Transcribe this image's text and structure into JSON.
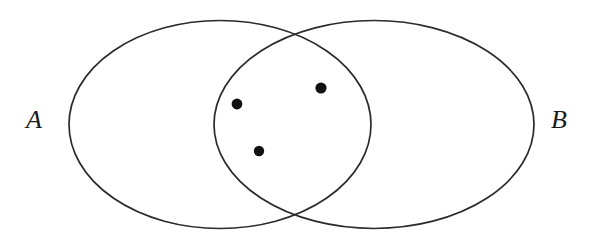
{
  "figure": {
    "type": "venn-diagram",
    "background_color": "#ffffff",
    "stroke_color": "#2b2b2b",
    "stroke_width": 1.7,
    "dot_color": "#111111",
    "width": 605,
    "height": 237
  },
  "sets": [
    {
      "id": "set-a",
      "label": "A",
      "label_x": 26,
      "label_y": 107,
      "shape": "ellipse",
      "cx": 220,
      "cy": 124.5,
      "rx": 151,
      "ry": 104
    },
    {
      "id": "set-b",
      "label": "B",
      "label_x": 551,
      "label_y": 107,
      "shape": "ellipse",
      "cx": 374,
      "cy": 124.5,
      "rx": 160,
      "ry": 104
    }
  ],
  "elements": {
    "region": "intersection",
    "count": 3,
    "points": [
      {
        "id": "element-1",
        "cx": 237,
        "cy": 104,
        "r": 5.4
      },
      {
        "id": "element-2",
        "cx": 321,
        "cy": 88,
        "r": 5.6
      },
      {
        "id": "element-3",
        "cx": 259,
        "cy": 151,
        "r": 5.2
      }
    ]
  }
}
